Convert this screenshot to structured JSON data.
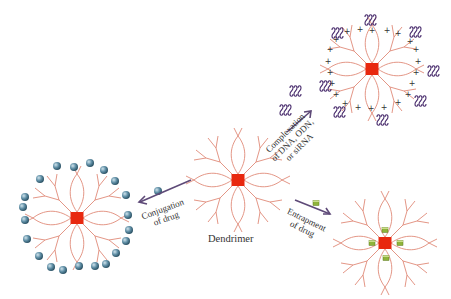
{
  "diagram": {
    "center": {
      "label": "Dendrimer",
      "core_color": "#e8280f",
      "branch_color": "#e08a78"
    },
    "pathways": [
      {
        "id": "conjugation",
        "label_line1": "Conjugation",
        "label_line2": "of drug",
        "direction": "left",
        "drug_glyph": "blue-sphere",
        "drug_color": "#4f7f96"
      },
      {
        "id": "complexation",
        "label_line1": "Complexation",
        "label_line2": "of DNA, ODN,",
        "label_line3": "or siRNA",
        "direction": "up-right",
        "drug_glyph": "dna-coil",
        "drug_color": "#4a2e6e",
        "surface_charge": "+"
      },
      {
        "id": "entrapment",
        "label_line1": "Entrapment",
        "label_line2": "of drug",
        "direction": "down-right",
        "drug_glyph": "green-cube",
        "drug_color": "#8fb43a"
      }
    ],
    "arrow_color": "#5e4a78"
  }
}
